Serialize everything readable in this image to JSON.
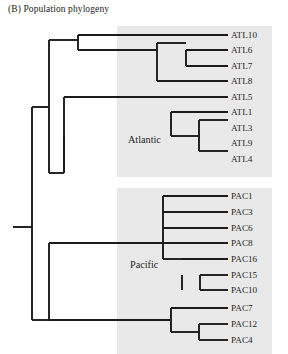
{
  "figure": {
    "caption_label": "(B)",
    "caption_text": "Population phylogeny",
    "caption_full": "(B)  Population phylogeny"
  },
  "colors": {
    "band_fill": "#e9e9e9",
    "branch_stroke": "#1b1b1b",
    "text": "#1f1f1f",
    "background": "#ffffff"
  },
  "groups": [
    {
      "id": "atlantic",
      "label": "Atlantic",
      "label_x": 128,
      "label_y": 143,
      "band": {
        "x": 117,
        "y": 26,
        "width": 155,
        "height": 151
      },
      "tips": [
        {
          "name": "ATL10",
          "y": 35
        },
        {
          "name": "ATL6",
          "y": 50
        },
        {
          "name": "ATL7",
          "y": 66
        },
        {
          "name": "ATL8",
          "y": 81
        },
        {
          "name": "ATL5",
          "y": 97
        },
        {
          "name": "ATL1",
          "y": 112
        },
        {
          "name": "ATL3",
          "y": 128
        },
        {
          "name": "ATL9",
          "y": 143
        },
        {
          "name": "ATL4",
          "y": 159
        }
      ]
    },
    {
      "id": "pacific",
      "label": "Pacific",
      "label_x": 130,
      "label_y": 268,
      "band": {
        "x": 117,
        "y": 188,
        "width": 155,
        "height": 166
      },
      "tips": [
        {
          "name": "PAC1",
          "y": 196
        },
        {
          "name": "PAC3",
          "y": 212
        },
        {
          "name": "PAC6",
          "y": 228
        },
        {
          "name": "PAC8",
          "y": 243
        },
        {
          "name": "PAC16",
          "y": 259
        },
        {
          "name": "PAC15",
          "y": 275
        },
        {
          "name": "PAC10",
          "y": 290
        },
        {
          "name": "PAC7",
          "y": 308
        },
        {
          "name": "PAC12",
          "y": 324
        },
        {
          "name": "PAC4",
          "y": 340
        }
      ]
    }
  ],
  "tip_label_x": 231,
  "tree_paths": [
    "M 13 227 L 32 227",
    "M 32 107 L 32 320",
    "M 32 107 L 49 107",
    "M 49 40 L 49 173",
    "M 49 40 L 78 40",
    "M 78 35 L 78 50",
    "M 78 35 L 157 35",
    "M 157 35 L 228 35",
    "M 78 50 L 157 50",
    "M 157 43 L 157 81",
    "M 157 43 L 186 43",
    "M 186 50 L 186 66",
    "M 186 50 L 228 50",
    "M 186 66 L 228 66",
    "M 157 81 L 228 81",
    "M 49 173 L 64 173",
    "M 64 97 L 64 173",
    "M 64 97 L 228 97",
    "M 64 136 L 64 173",
    "M 171 112 L 171 136",
    "M 171 112 L 228 112",
    "M 171 136 L 199 136",
    "M 199 120 L 199 151",
    "M 199 120 L 228 120",
    "M 199 151 L 228 151",
    "M 32 320 L 49 320",
    "M 49 243 L 49 320",
    "M 49 243 L 163 243",
    "M 163 196 L 163 259",
    "M 163 196 L 228 196",
    "M 163 212 L 228 212",
    "M 163 228 L 228 228",
    "M 163 243 L 228 243",
    "M 163 259 L 182 259",
    "M 182 259 L 228 259",
    "M 182 275 L 182 290",
    "M 200 275 L 200 290",
    "M 200 275 L 228 275",
    "M 200 290 L 228 290",
    "M 49 320 L 171 320",
    "M 171 308 L 171 332",
    "M 171 308 L 228 308",
    "M 171 332 L 199 332",
    "M 199 324 L 199 340",
    "M 199 324 L 228 324",
    "M 199 340 L 228 340"
  ]
}
